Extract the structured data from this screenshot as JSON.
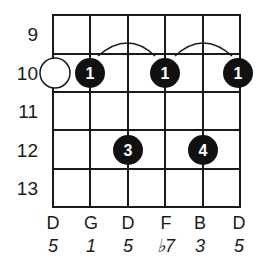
{
  "diagram": {
    "type": "guitar-chord-diagram",
    "fret_numbers": [
      "9",
      "10",
      "11",
      "12",
      "13"
    ],
    "strings": [
      {
        "note": "D",
        "interval": "5"
      },
      {
        "note": "G",
        "interval": "1"
      },
      {
        "note": "D",
        "interval": "5"
      },
      {
        "note": "F",
        "interval": "♭7"
      },
      {
        "note": "B",
        "interval": "3"
      },
      {
        "note": "D",
        "interval": "5"
      }
    ],
    "open_marker": {
      "string": 0,
      "fret_row": 1,
      "label": ""
    },
    "fingers": [
      {
        "string": 1,
        "fret_row": 1,
        "label": "1"
      },
      {
        "string": 3,
        "fret_row": 1,
        "label": "1"
      },
      {
        "string": 5,
        "fret_row": 1,
        "label": "1"
      },
      {
        "string": 2,
        "fret_row": 3,
        "label": "3"
      },
      {
        "string": 4,
        "fret_row": 3,
        "label": "4"
      }
    ],
    "ties": [
      {
        "from_string": 1,
        "to_string": 3
      },
      {
        "from_string": 3,
        "to_string": 5
      }
    ],
    "colors": {
      "line": "#1a1a1a",
      "dot": "#111111",
      "dot_text": "#ffffff",
      "background": "#ffffff"
    }
  }
}
